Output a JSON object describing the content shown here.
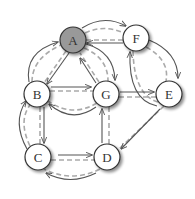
{
  "diagram": {
    "type": "directed-graph",
    "colors": {
      "edge_solid": "#555555",
      "edge_dashed": "#aaaaaa",
      "node_fill": "#ffffff",
      "node_highlight_fill": "#999999",
      "node_stroke": "#333333"
    },
    "nodes": [
      {
        "id": "A",
        "label": "A",
        "x": 73,
        "y": 40,
        "highlighted": true
      },
      {
        "id": "F",
        "label": "F",
        "x": 136,
        "y": 38,
        "highlighted": false
      },
      {
        "id": "B",
        "label": "B",
        "x": 37,
        "y": 94,
        "highlighted": false
      },
      {
        "id": "G",
        "label": "G",
        "x": 106,
        "y": 94,
        "highlighted": false
      },
      {
        "id": "E",
        "label": "E",
        "x": 169,
        "y": 94,
        "highlighted": false
      },
      {
        "id": "C",
        "label": "C",
        "x": 38,
        "y": 157,
        "highlighted": false
      },
      {
        "id": "D",
        "label": "D",
        "x": 107,
        "y": 157,
        "highlighted": false
      }
    ],
    "edges": [
      {
        "from": "A",
        "to": "F",
        "style": "curved-up"
      },
      {
        "from": "F",
        "to": "A",
        "style": "straight"
      },
      {
        "from": "B",
        "to": "A",
        "style": "curved-left"
      },
      {
        "from": "A",
        "to": "B",
        "style": "straight"
      },
      {
        "from": "A",
        "to": "G",
        "style": "curved-right"
      },
      {
        "from": "G",
        "to": "A",
        "style": "straight"
      },
      {
        "from": "B",
        "to": "G",
        "style": "straight"
      },
      {
        "from": "G",
        "to": "B",
        "style": "curved-down"
      },
      {
        "from": "G",
        "to": "E",
        "style": "straight"
      },
      {
        "from": "F",
        "to": "E",
        "style": "curved-right"
      },
      {
        "from": "E",
        "to": "F",
        "style": "curved-left"
      },
      {
        "from": "B",
        "to": "C",
        "style": "straight"
      },
      {
        "from": "C",
        "to": "B",
        "style": "curved-left"
      },
      {
        "from": "C",
        "to": "D",
        "style": "straight"
      },
      {
        "from": "D",
        "to": "C",
        "style": "curved-down"
      },
      {
        "from": "D",
        "to": "G",
        "style": "straight"
      },
      {
        "from": "E",
        "to": "D",
        "style": "straight"
      }
    ]
  }
}
